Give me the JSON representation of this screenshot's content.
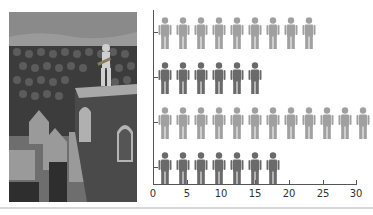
{
  "chart_data": {
    "type": "bar",
    "subtype": "pictograph",
    "title": "",
    "xlabel": "",
    "ylabel": "",
    "categories": [
      "Row 1",
      "Row 2",
      "Row 3",
      "Row 4"
    ],
    "values": [
      23,
      15,
      31,
      18
    ],
    "icon_counts": [
      9,
      6,
      12,
      7
    ],
    "colors": [
      "#a0a0a0",
      "#6a6a6a",
      "#a0a0a0",
      "#6a6a6a"
    ],
    "xlim": [
      0,
      30
    ],
    "x_ticks": [
      "0",
      "5",
      "10",
      "15",
      "20",
      "25",
      "30"
    ],
    "grid": false,
    "legend": null,
    "icon": "person-icon"
  },
  "image": {
    "description": "Illustration of a man with a guitar standing on a rooftop above a crowd of identical houses"
  }
}
